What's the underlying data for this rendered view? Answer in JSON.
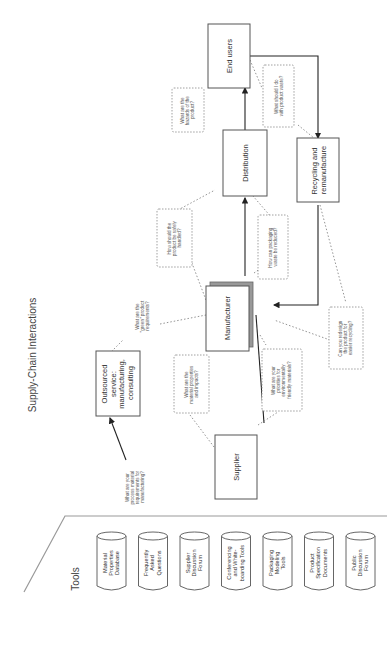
{
  "diagram": {
    "title": "Supply-Chain Interactions",
    "nodes": {
      "supplier": "Supplier",
      "manufacturer": "Manufacturer",
      "distribution": "Distribution",
      "end_users": "End users",
      "recycling": [
        "Recycling and",
        "remanufacture"
      ],
      "outsourced": [
        "Outsourced",
        "service:",
        "manufacturing,",
        "consulting"
      ]
    },
    "questions": {
      "process_requirements": [
        "What are your",
        "process material",
        "requirements for",
        "manufacturing?"
      ],
      "material_properties": [
        "What are the",
        "material properties",
        "and impacts?"
      ],
      "green_requirements": [
        "What are the",
        "\"green\" product",
        "requirements?"
      ],
      "priorities": [
        "What are your",
        "priorities for",
        "environmentally",
        "friendly materials?"
      ],
      "safely_handled": [
        "How should the",
        "product be safely",
        "handled?"
      ],
      "packaging_waste": [
        "How can packaging",
        "waste be reduced?"
      ],
      "hazards": [
        "What are the",
        "hazards of the",
        "product?"
      ],
      "product_waste": [
        "What should I do",
        "with product waste?"
      ],
      "redesign": [
        "Can you redesign",
        "the product for",
        "easier recycling?"
      ]
    }
  },
  "tools": {
    "title": "Tools",
    "items": [
      [
        "Material",
        "Properties",
        "Database"
      ],
      [
        "Frequently",
        "Asked",
        "Questions"
      ],
      [
        "Supplier",
        "Discussion",
        "Forum"
      ],
      [
        "Conferencing",
        "and White-",
        "boarding Tools"
      ],
      [
        "Packaging",
        "Modeling",
        "Tools"
      ],
      [
        "Product",
        "Specification",
        "Documents"
      ],
      [
        "Public",
        "Discussion",
        "Forum"
      ]
    ]
  }
}
